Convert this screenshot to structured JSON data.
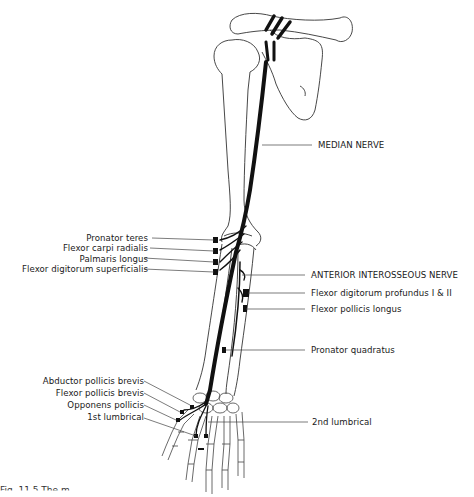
{
  "diagram": {
    "colors": {
      "nerve": "#111111",
      "bone_outline": "#333333",
      "leader_line": "#444444",
      "background": "#ffffff"
    },
    "labels_right": [
      {
        "id": "median-nerve",
        "text": "MEDIAN NERVE"
      },
      {
        "id": "anterior-interosseous-nerve",
        "text": "ANTERIOR INTEROSSEOUS NERVE"
      },
      {
        "id": "flexor-digitorum-profundus",
        "text": "Flexor digitorum profundus I & II"
      },
      {
        "id": "flexor-pollicis-longus",
        "text": "Flexor pollicis longus"
      },
      {
        "id": "pronator-quadratus",
        "text": "Pronator quadratus"
      },
      {
        "id": "2nd-lumbrical",
        "text": "2nd lumbrical"
      }
    ],
    "labels_left": [
      {
        "id": "pronator-teres",
        "text": "Pronator teres"
      },
      {
        "id": "flexor-carpi-radialis",
        "text": "Flexor carpi radialis"
      },
      {
        "id": "palmaris-longus",
        "text": "Palmaris longus"
      },
      {
        "id": "flexor-digitorum-superficialis",
        "text": "Flexor digitorum superficialis"
      },
      {
        "id": "abductor-pollicis-brevis",
        "text": "Abductor pollicis brevis"
      },
      {
        "id": "flexor-pollicis-brevis",
        "text": "Flexor pollicis brevis"
      },
      {
        "id": "opponens-pollicis",
        "text": "Opponens pollicis"
      },
      {
        "id": "1st-lumbrical",
        "text": "1st lumbrical"
      }
    ],
    "caption": "Fig. 11.5 The m"
  }
}
